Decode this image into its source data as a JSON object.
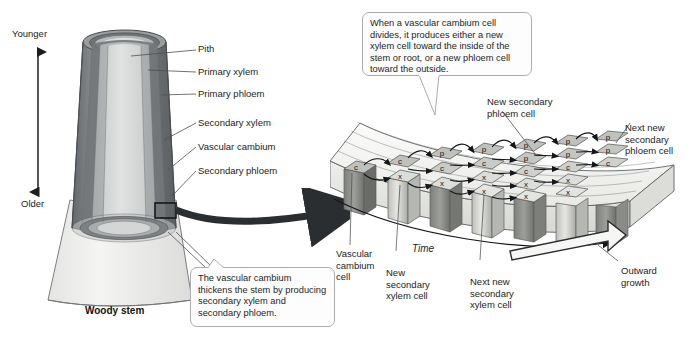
{
  "figure": {
    "left_panel": {
      "caption": "Woody stem",
      "axis": {
        "top_label": "Younger",
        "bottom_label": "Older",
        "icon": "double-headed-vertical-arrow"
      },
      "leader_labels": [
        "Pith",
        "Primary xylem",
        "Primary phloem",
        "Secondary xylem",
        "Vascular cambium",
        "Secondary phloem"
      ],
      "callout": {
        "text": "The vascular cambium thickens the stem by producing secondary xylem and secondary phloem."
      },
      "inset_box": "magnified-region-box"
    },
    "zoom_arrow": {
      "icon": "curved-magnify-arrow"
    },
    "right_panel": {
      "callout": {
        "text": "When a vascular cambium cell divides, it produces either a new xylem cell toward the inside of the stem or root, or a new phloem cell toward the outside."
      },
      "labels": {
        "new_secondary_phloem": "New secondary\nphloem cell",
        "next_new_secondary_phloem": "Next new\nsecondary\nphloem cell",
        "vascular_cambium_cell": "Vascular\ncambium\ncell",
        "new_secondary_xylem": "New\nsecondary\nxylem cell",
        "next_new_secondary_xylem": "Next new\nsecondary\nxylem cell",
        "outward_growth": "Outward\ngrowth",
        "time": "Time"
      },
      "cell_codes": {
        "cambium": "c",
        "xylem": "x",
        "phloem": "p"
      },
      "stages": [
        {
          "stage": 1,
          "cells": [
            "c"
          ]
        },
        {
          "stage": 2,
          "cells": [
            "c",
            "x"
          ]
        },
        {
          "stage": 3,
          "cells": [
            "p",
            "c",
            "x"
          ]
        },
        {
          "stage": 4,
          "cells": [
            "p",
            "c",
            "x",
            "x"
          ]
        },
        {
          "stage": 5,
          "cells": [
            "p",
            "p",
            "c",
            "x",
            "x"
          ]
        }
      ],
      "time_arrow": "rightward-time-arrow",
      "growth_arrow": "outward-growth-block-arrow"
    },
    "colors": {
      "pith": "#d9dbdb",
      "primary_xylem": "#b9bcbc",
      "primary_phloem": "#8d9091",
      "secondary_layer": "#6f7273",
      "outline": "#4a4d4f",
      "slab_top": "#f2f2f0",
      "cell_face": "#c9cac6",
      "cell_side": "#9a9c98",
      "callout_border": "#a9adb0",
      "text": "#1d1d1d"
    }
  }
}
